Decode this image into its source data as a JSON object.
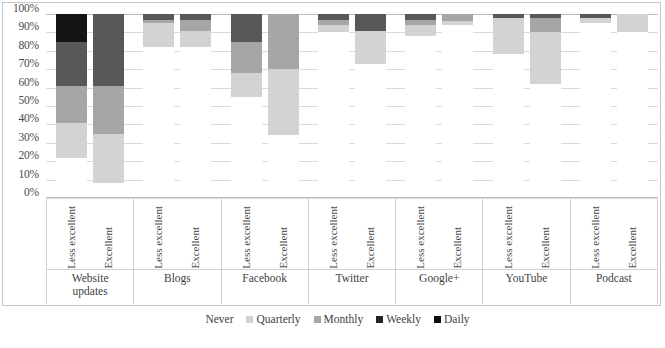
{
  "chart_data": {
    "type": "bar",
    "subtype": "100% stacked bar",
    "title": "",
    "xlabel": "",
    "ylabel": "",
    "ylim": [
      0,
      100
    ],
    "ytick_labels": [
      "100%",
      "90%",
      "80%",
      "70%",
      "60%",
      "50%",
      "40%",
      "30%",
      "20%",
      "10%",
      "0%"
    ],
    "ytick_values": [
      100,
      90,
      80,
      70,
      60,
      50,
      40,
      30,
      20,
      10,
      0
    ],
    "grid": true,
    "legend_position": "bottom",
    "stack_order_bottom_to_top": [
      "Never",
      "Quarterly",
      "Monthly",
      "Weekly",
      "Daily"
    ],
    "series": [
      {
        "name": "Never",
        "color": "#ffffff"
      },
      {
        "name": "Quarterly",
        "color": "#d3d3d3"
      },
      {
        "name": "Monthly",
        "color": "#a6a6a6"
      },
      {
        "name": "Weekly",
        "color": "#585858"
      },
      {
        "name": "Daily",
        "color": "#141414"
      }
    ],
    "sub_categories": [
      "Less excellent",
      "Excellent"
    ],
    "categories": [
      "Website updates",
      "Blogs",
      "Facebook",
      "Twitter",
      "Google+",
      "YouTube",
      "Podcast"
    ],
    "groups": [
      {
        "category": "Website updates",
        "bars": [
          {
            "sub": "Less excellent",
            "values": {
              "Never": 22,
              "Quarterly": 19,
              "Monthly": 20,
              "Weekly": 24,
              "Daily": 15
            }
          },
          {
            "sub": "Excellent",
            "values": {
              "Never": 8,
              "Quarterly": 27,
              "Monthly": 26,
              "Weekly": 39,
              "Daily": 0
            }
          }
        ]
      },
      {
        "category": "Blogs",
        "bars": [
          {
            "sub": "Less excellent",
            "values": {
              "Never": 82,
              "Quarterly": 13,
              "Monthly": 2,
              "Weekly": 3,
              "Daily": 0
            }
          },
          {
            "sub": "Excellent",
            "values": {
              "Never": 82,
              "Quarterly": 9,
              "Monthly": 6,
              "Weekly": 3,
              "Daily": 0
            }
          }
        ]
      },
      {
        "category": "Facebook",
        "bars": [
          {
            "sub": "Less excellent",
            "values": {
              "Never": 55,
              "Quarterly": 13,
              "Monthly": 17,
              "Weekly": 15,
              "Daily": 0
            }
          },
          {
            "sub": "Excellent",
            "values": {
              "Never": 34,
              "Quarterly": 36,
              "Monthly": 30,
              "Weekly": 0,
              "Daily": 0
            }
          }
        ]
      },
      {
        "category": "Twitter",
        "bars": [
          {
            "sub": "Less excellent",
            "values": {
              "Never": 90,
              "Quarterly": 4,
              "Monthly": 3,
              "Weekly": 3,
              "Daily": 0
            }
          },
          {
            "sub": "Excellent",
            "values": {
              "Never": 73,
              "Quarterly": 18,
              "Monthly": 0,
              "Weekly": 9,
              "Daily": 0
            }
          }
        ]
      },
      {
        "category": "Google+",
        "bars": [
          {
            "sub": "Less excellent",
            "values": {
              "Never": 88,
              "Quarterly": 6,
              "Monthly": 3,
              "Weekly": 3,
              "Daily": 0
            }
          },
          {
            "sub": "Excellent",
            "values": {
              "Never": 94,
              "Quarterly": 2,
              "Monthly": 4,
              "Weekly": 0,
              "Daily": 0
            }
          }
        ]
      },
      {
        "category": "YouTube",
        "bars": [
          {
            "sub": "Less excellent",
            "values": {
              "Never": 78,
              "Quarterly": 20,
              "Monthly": 0,
              "Weekly": 2,
              "Daily": 0
            }
          },
          {
            "sub": "Excellent",
            "values": {
              "Never": 62,
              "Quarterly": 28,
              "Monthly": 8,
              "Weekly": 2,
              "Daily": 0
            }
          }
        ]
      },
      {
        "category": "Podcast",
        "bars": [
          {
            "sub": "Less excellent",
            "values": {
              "Never": 95,
              "Quarterly": 3,
              "Monthly": 0,
              "Weekly": 2,
              "Daily": 0
            }
          },
          {
            "sub": "Excellent",
            "values": {
              "Never": 90,
              "Quarterly": 10,
              "Monthly": 0,
              "Weekly": 0,
              "Daily": 0
            }
          }
        ]
      }
    ]
  }
}
